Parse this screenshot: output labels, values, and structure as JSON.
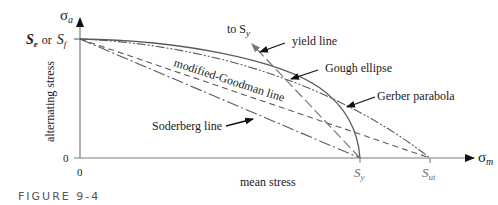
{
  "figure": {
    "caption": "FIGURE 9-4"
  },
  "axes": {
    "y_symbol": "σ",
    "y_subscript": "a",
    "x_symbol": "σ",
    "x_subscript": "m",
    "y_label": "alternating stress",
    "x_label": "mean stress",
    "y_zero": "0",
    "x_zero": "0",
    "y_intercept_label_1": "S",
    "y_intercept_sub_1": "e",
    "y_intercept_or": "or",
    "y_intercept_label_2": "S",
    "y_intercept_sub_2": "f",
    "x_tick_sy": "S",
    "x_tick_sy_sub": "y",
    "x_tick_sut": "S",
    "x_tick_sut_sub": "ut"
  },
  "annotations": {
    "to_sy": "to S",
    "to_sy_sub": "y",
    "yield_line": "yield line",
    "gough_ellipse": "Gough ellipse",
    "gerber_parabola": "Gerber parabola",
    "modified_goodman": "modified-Goodman line",
    "soderberg": "Soderberg line"
  },
  "colors": {
    "axis": "#7a7a7a",
    "curve": "#5a5a5a",
    "text": "#1a1a1a",
    "arrow": "#111111"
  }
}
